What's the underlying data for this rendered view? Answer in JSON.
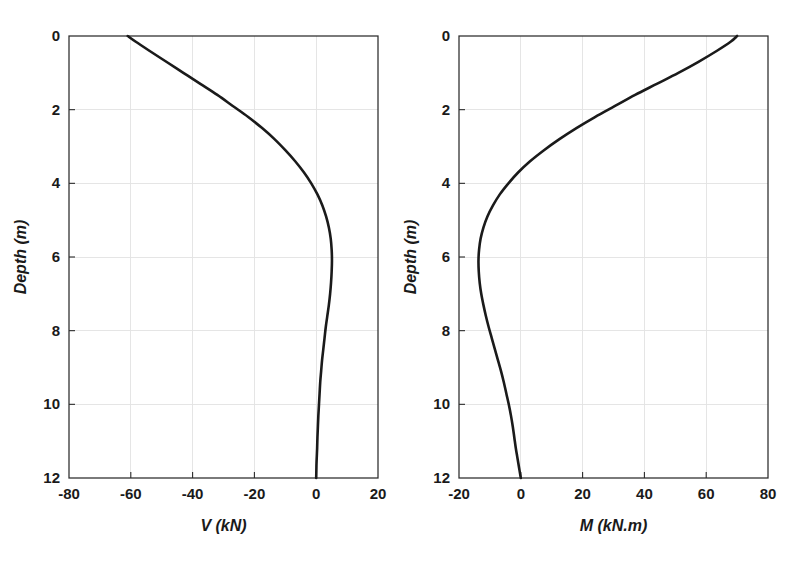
{
  "figure": {
    "background": "#ffffff",
    "curve_color": "#1a1a1a",
    "grid_color": "#e2e2e2",
    "axis_color": "#2b2b2b"
  },
  "chart_data": [
    {
      "type": "line",
      "id": "shear-force-profile",
      "title": "",
      "xlabel": "V (kN)",
      "ylabel": "Depth (m)",
      "xlim": [
        -80,
        20
      ],
      "ylim": [
        0,
        12
      ],
      "y_inverted": true,
      "grid": true,
      "legend": "none",
      "xticks": [
        -80,
        -60,
        -40,
        -20,
        0,
        20
      ],
      "xticklabels": [
        "-80",
        "-60",
        "-40",
        "-20",
        "0",
        "20"
      ],
      "yticks": [
        0,
        2,
        4,
        6,
        8,
        10,
        12
      ],
      "yticklabels": [
        "0",
        "2",
        "4",
        "6",
        "8",
        "10",
        "12"
      ],
      "series": [
        {
          "name": "V",
          "x": [
            -61.0,
            -58.5,
            -54.0,
            -48.5,
            -43.0,
            -37.5,
            -32.0,
            -27.0,
            -22.0,
            -17.5,
            -13.5,
            -10.0,
            -6.8,
            -4.0,
            -1.6,
            0.4,
            2.0,
            3.2,
            4.1,
            4.7,
            5.0,
            5.1,
            5.0,
            4.8,
            4.5,
            4.1,
            3.6,
            3.1,
            2.7,
            2.3,
            1.9,
            1.6,
            1.3,
            1.1,
            0.9,
            0.7,
            0.55,
            0.4,
            0.3,
            0.2,
            0.1,
            0.05,
            0.0
          ],
          "y": [
            0.0,
            0.15,
            0.4,
            0.7,
            1.0,
            1.3,
            1.6,
            1.9,
            2.2,
            2.5,
            2.8,
            3.1,
            3.4,
            3.7,
            4.0,
            4.3,
            4.6,
            4.9,
            5.2,
            5.5,
            5.8,
            6.1,
            6.4,
            6.7,
            7.0,
            7.3,
            7.6,
            7.9,
            8.2,
            8.5,
            8.8,
            9.1,
            9.4,
            9.7,
            10.0,
            10.3,
            10.6,
            10.9,
            11.2,
            11.4,
            11.6,
            11.8,
            12.0
          ]
        }
      ]
    },
    {
      "type": "line",
      "id": "bending-moment-profile",
      "title": "",
      "xlabel": "M (kN.m)",
      "ylabel": "Depth (m)",
      "xlim": [
        -20,
        80
      ],
      "ylim": [
        0,
        12
      ],
      "y_inverted": true,
      "grid": true,
      "legend": "none",
      "xticks": [
        -20,
        0,
        20,
        40,
        60,
        80
      ],
      "xticklabels": [
        "-20",
        "0",
        "20",
        "40",
        "60",
        "80"
      ],
      "yticks": [
        0,
        2,
        4,
        6,
        8,
        10,
        12
      ],
      "yticklabels": [
        "0",
        "2",
        "4",
        "6",
        "8",
        "10",
        "12"
      ],
      "series": [
        {
          "name": "M",
          "x": [
            70.0,
            68.0,
            63.5,
            57.5,
            51.0,
            44.0,
            37.0,
            30.5,
            24.0,
            18.0,
            12.5,
            7.5,
            3.0,
            -0.8,
            -4.0,
            -6.8,
            -9.0,
            -10.8,
            -12.1,
            -13.0,
            -13.5,
            -13.7,
            -13.6,
            -13.3,
            -12.8,
            -12.1,
            -11.3,
            -10.4,
            -9.4,
            -8.4,
            -7.4,
            -6.4,
            -5.5,
            -4.7,
            -3.9,
            -3.2,
            -2.6,
            -2.1,
            -1.6,
            -1.2,
            -0.8,
            -0.4,
            0.0
          ],
          "y": [
            0.0,
            0.15,
            0.4,
            0.7,
            1.0,
            1.3,
            1.6,
            1.9,
            2.2,
            2.5,
            2.8,
            3.1,
            3.4,
            3.7,
            4.0,
            4.3,
            4.6,
            4.9,
            5.2,
            5.5,
            5.8,
            6.1,
            6.4,
            6.7,
            7.0,
            7.3,
            7.6,
            7.9,
            8.2,
            8.5,
            8.8,
            9.1,
            9.4,
            9.7,
            10.0,
            10.3,
            10.6,
            10.9,
            11.2,
            11.4,
            11.6,
            11.8,
            12.0
          ]
        }
      ]
    }
  ]
}
